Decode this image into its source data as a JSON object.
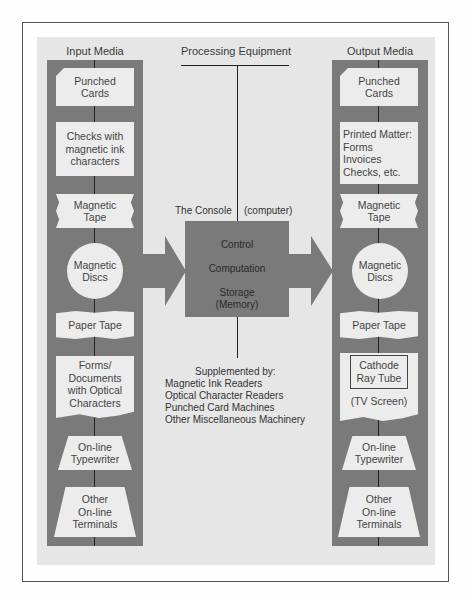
{
  "diagram": {
    "headings": {
      "input": "Input Media",
      "processing": "Processing Equipment",
      "output": "Output Media"
    },
    "input_media": [
      {
        "label": "Punched\nCards",
        "shape": "card"
      },
      {
        "label": "Checks with\nmagnetic ink\ncharacters",
        "shape": "rectangle"
      },
      {
        "label": "Magnetic\nTape",
        "shape": "tape"
      },
      {
        "label": "Magnetic\nDiscs",
        "shape": "circle"
      },
      {
        "label": "Paper Tape",
        "shape": "wavy"
      },
      {
        "label": "Forms/\nDocuments\nwith Optical\nCharacters",
        "shape": "document"
      },
      {
        "label": "On-line\nTypewriter",
        "shape": "trapezoid"
      },
      {
        "label": "Other\nOn-line\nTerminals",
        "shape": "trapezoid"
      }
    ],
    "output_media": [
      {
        "label": "Punched\nCards",
        "shape": "card"
      },
      {
        "label": "Printed Matter:\nForms\nInvoices\nChecks, etc.",
        "shape": "rectangle"
      },
      {
        "label": "Magnetic\nTape",
        "shape": "tape"
      },
      {
        "label": "Magnetic\nDiscs",
        "shape": "circle"
      },
      {
        "label": "Paper Tape",
        "shape": "wavy"
      },
      {
        "label": "Cathode\nRay Tube",
        "sublabel": "(TV Screen)",
        "shape": "display"
      },
      {
        "label": "On-line\nTypewriter",
        "shape": "trapezoid"
      },
      {
        "label": "Other\nOn-line\nTerminals",
        "shape": "trapezoid"
      }
    ],
    "console": {
      "title": "The Console",
      "subtitle": "(computer)",
      "functions": [
        "Control",
        "Computation",
        "Storage\n(Memory)"
      ]
    },
    "supplemented": {
      "title": "Supplemented by:",
      "items": [
        "Magnetic Ink Readers",
        "Optical Character Readers",
        "Punched Card Machines",
        "Other Miscellaneous Machinery"
      ]
    }
  }
}
